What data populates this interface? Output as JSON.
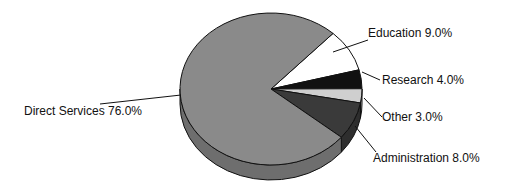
{
  "chart_data": {
    "type": "pie",
    "title": "",
    "categories": [
      "Direct Services",
      "Education",
      "Research",
      "Other",
      "Administration"
    ],
    "values": [
      76.0,
      9.0,
      4.0,
      3.0,
      8.0
    ],
    "labels": [
      "Direct Services 76.0%",
      "Education 9.0%",
      "Research 4.0%",
      "Other 3.0%",
      "Administration 8.0%"
    ],
    "colors": [
      "#8a8a8a",
      "#ffffff",
      "#111111",
      "#cfcfcf",
      "#3a3a3a"
    ],
    "style": "3d"
  }
}
